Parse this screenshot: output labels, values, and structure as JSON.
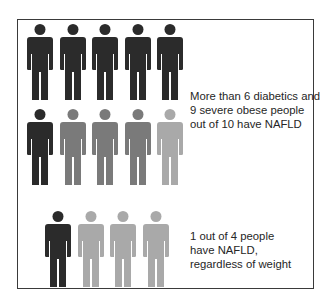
{
  "colors": {
    "dark": "#2b2b2b",
    "medium": "#7a7a7a",
    "light": "#a9a9a9",
    "border": "#3a3a3a",
    "text": "#262626"
  },
  "groups": [
    {
      "name": "diabetics-and-obese",
      "rows": [
        [
          "dark",
          "dark",
          "dark",
          "dark",
          "dark"
        ],
        [
          "dark",
          "medium",
          "medium",
          "medium",
          "light"
        ]
      ],
      "caption_lines": [
        "More than 6 diabetics and",
        "9 severe obese people",
        "out of 10 have NAFLD"
      ]
    },
    {
      "name": "general-population",
      "rows": [
        [
          "dark",
          "light",
          "light",
          "light"
        ]
      ],
      "caption_lines": [
        "1 out of 4 people",
        "have NAFLD,",
        "regardless of weight"
      ]
    }
  ]
}
